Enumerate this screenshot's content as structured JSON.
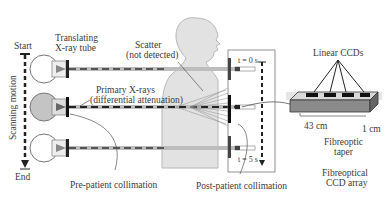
{
  "diagram": {
    "title_fragment": "",
    "labels": {
      "start": "Start",
      "end": "End",
      "scanning_motion": "Scanning motion",
      "tube_line1": "Translating",
      "tube_line2": "X-ray tube",
      "scatter_line1": "Scatter",
      "scatter_line2": "(not detected)",
      "primary_line1": "Primary X-rays",
      "primary_line2": "(differential attenuation)",
      "t0": "t = 0 s",
      "t5": "t = 5 s",
      "linear_ccds": "Linear CCDs",
      "dim_43": "43 cm",
      "dim_1": "1 cm",
      "taper_line1": "Fibreoptic",
      "taper_line2": "taper",
      "array_line1": "Fibreoptical",
      "array_line2": "CCD array",
      "pre_patient": "Pre-patient collimation",
      "post_patient": "Post-patient collimation"
    },
    "colors": {
      "line": "#333333",
      "patient_fill": "#e2e2e2",
      "patient_stroke": "#b8b8b8",
      "beam_gray": "#bdbdbd",
      "tube_active": "#c4c4c4"
    }
  }
}
